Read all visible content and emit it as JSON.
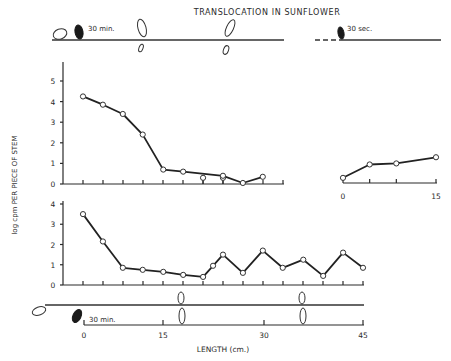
{
  "chart_data": [
    {
      "id": "upper-left",
      "type": "line",
      "title": "TRANSLOCATION IN SUNFLOWER",
      "subtitle_diagram_label": "30 min.",
      "ylabel": "log cpm PER PIECE OF STEM",
      "xlabel": "",
      "ylim": [
        0,
        5
      ],
      "yticks": [
        "0",
        "1",
        "2",
        "3",
        "4",
        "5"
      ],
      "xlim": [
        0,
        35
      ],
      "x": [
        0,
        3.2,
        6.4,
        9.6,
        12.9,
        16.1,
        22.5,
        25.7,
        28.9
      ],
      "values": [
        4.25,
        3.85,
        3.4,
        2.4,
        0.7,
        0.6,
        0.4,
        0.05,
        0.35
      ],
      "extra_points": {
        "x": [
          19.3,
          22.5
        ],
        "values": [
          0.3,
          0.3
        ]
      }
    },
    {
      "id": "upper-right",
      "type": "line",
      "subtitle_diagram_label": "30 sec.",
      "xlim": [
        0,
        15
      ],
      "xticks": [
        "0",
        "15"
      ],
      "ylim": [
        0,
        5
      ],
      "x": [
        0,
        4.3,
        8.6,
        15
      ],
      "values": [
        0.25,
        0.9,
        0.95,
        1.25
      ]
    },
    {
      "id": "lower",
      "type": "line",
      "ylim": [
        0,
        4
      ],
      "yticks": [
        "0",
        "1",
        "2",
        "3",
        "4"
      ],
      "xlim": [
        0,
        45
      ],
      "xticks": [
        "0",
        "15",
        "30",
        "45"
      ],
      "xlabel": "LENGTH (cm.)",
      "diagram_label": "30 min.",
      "x": [
        0,
        3.2,
        6.4,
        9.6,
        12.9,
        16.1,
        19.3,
        20.9,
        22.5,
        25.7,
        28.9,
        32.1,
        35.4,
        38.6,
        41.8,
        45
      ],
      "values": [
        3.5,
        2.15,
        0.85,
        0.75,
        0.65,
        0.5,
        0.4,
        0.95,
        1.5,
        0.6,
        1.7,
        0.85,
        1.25,
        0.45,
        1.6,
        0.85
      ]
    }
  ]
}
